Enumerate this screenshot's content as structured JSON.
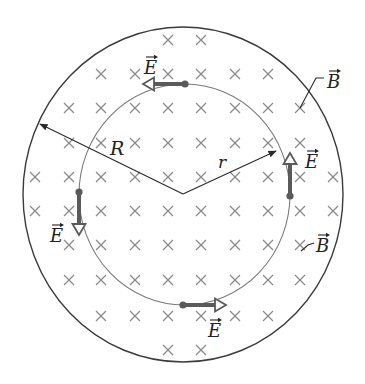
{
  "diagram": {
    "colors": {
      "outline": "#3a3a3a",
      "inner_circle": "#7a7a7a",
      "xmark": "#8a8a8a",
      "e_vector": "#5a5a5a",
      "text": "#222222"
    },
    "outer_region": {
      "cx": 183,
      "cy": 194.5,
      "rx": 160,
      "ry": 167.5
    },
    "inner_path": {
      "cx": 184.5,
      "cy": 194.5,
      "rx": 105.5,
      "ry": 110.5
    },
    "center": {
      "x": 183,
      "y": 194
    },
    "radius_labels": {
      "R": {
        "label": "R",
        "tip": {
          "x": 40,
          "y": 124
        },
        "label_pos": {
          "x": 110,
          "y": 155
        }
      },
      "r": {
        "label": "r",
        "tip": {
          "x": 276,
          "y": 151
        },
        "label_pos": {
          "x": 218,
          "y": 168
        }
      }
    },
    "field_into_page_marks": {
      "symbol": "×",
      "rows": [
        {
          "y": 40,
          "xs": [
            168,
            201
          ]
        },
        {
          "y": 74,
          "xs": [
            101,
            135,
            168,
            201,
            235,
            268
          ]
        },
        {
          "y": 108,
          "xs": [
            69,
            101,
            135,
            168,
            201,
            235,
            268,
            300
          ]
        },
        {
          "y": 143,
          "xs": [
            69,
            101,
            135,
            168,
            201,
            235,
            268,
            300
          ]
        },
        {
          "y": 177,
          "xs": [
            35,
            69,
            101,
            135,
            168,
            201,
            235,
            268,
            300,
            333
          ]
        },
        {
          "y": 211,
          "xs": [
            35,
            69,
            101,
            135,
            168,
            201,
            235,
            268,
            300,
            333
          ]
        },
        {
          "y": 245,
          "xs": [
            69,
            101,
            135,
            168,
            201,
            235,
            268,
            300
          ]
        },
        {
          "y": 280,
          "xs": [
            69,
            101,
            135,
            168,
            201,
            235,
            268,
            300
          ]
        },
        {
          "y": 316,
          "xs": [
            101,
            135,
            168,
            201,
            235,
            268
          ]
        },
        {
          "y": 350,
          "xs": [
            168,
            201
          ]
        }
      ]
    },
    "e_vectors": [
      {
        "name": "e-vector-top",
        "label": "E",
        "direction": "left",
        "from": {
          "x": 185,
          "y": 84
        },
        "to": {
          "x": 143,
          "y": 84
        },
        "label_pos": {
          "x": 144,
          "y": 74
        }
      },
      {
        "name": "e-vector-right",
        "label": "E",
        "direction": "up",
        "from": {
          "x": 290,
          "y": 196
        },
        "to": {
          "x": 290,
          "y": 153
        },
        "label_pos": {
          "x": 305,
          "y": 168
        }
      },
      {
        "name": "e-vector-bottom",
        "label": "E",
        "direction": "right",
        "from": {
          "x": 183,
          "y": 305
        },
        "to": {
          "x": 226,
          "y": 305
        },
        "label_pos": {
          "x": 208,
          "y": 337
        }
      },
      {
        "name": "e-vector-left",
        "label": "E",
        "direction": "down",
        "from": {
          "x": 79,
          "y": 192
        },
        "to": {
          "x": 79,
          "y": 235
        },
        "label_pos": {
          "x": 50,
          "y": 242
        }
      }
    ],
    "b_labels": [
      {
        "name": "b-label-top",
        "label": "B",
        "leader": [
          [
            300,
            108
          ],
          [
            316,
            78
          ],
          [
            324,
            78
          ]
        ],
        "label_pos": {
          "x": 327,
          "y": 88
        }
      },
      {
        "name": "b-label-bottom",
        "label": "B",
        "leader": [
          [
            301,
            251
          ],
          [
            308,
            245
          ],
          [
            314,
            243
          ]
        ],
        "label_pos": {
          "x": 316,
          "y": 252
        }
      }
    ]
  }
}
